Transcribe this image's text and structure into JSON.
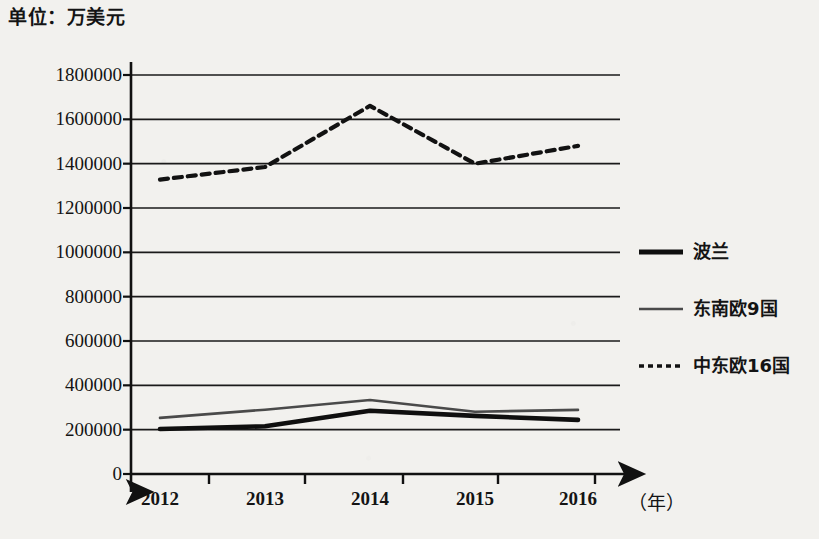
{
  "chart_data": {
    "type": "line",
    "title": "单位：万美元",
    "xlabel": "（年）",
    "ylabel": "",
    "categories": [
      "2012",
      "2013",
      "2014",
      "2015",
      "2016"
    ],
    "x_axis_title": "（年）",
    "ylim": [
      0,
      1800000
    ],
    "yticks": [
      "1800000",
      "1600000",
      "1400000",
      "1200000",
      "1000000",
      "800000",
      "600000",
      "400000",
      "200000",
      "0"
    ],
    "ytick_values": [
      1800000,
      1600000,
      1400000,
      1200000,
      1000000,
      800000,
      600000,
      400000,
      200000,
      0
    ],
    "grid": true,
    "grid_axis": "y",
    "legend_position": "right",
    "series": [
      {
        "name": "波兰",
        "style": "solid-thick",
        "color": "#0f0f0f",
        "values": [
          203000,
          215000,
          285000,
          262000,
          244000
        ]
      },
      {
        "name": "东南欧9国",
        "style": "solid-thin",
        "color": "#4a4a4a",
        "values": [
          253000,
          290000,
          334000,
          281000,
          289000
        ]
      },
      {
        "name": "中东欧16国",
        "style": "dashed",
        "color": "#121212",
        "values": [
          1328000,
          1385000,
          1661000,
          1400000,
          1480000
        ]
      }
    ]
  },
  "axis": {
    "y_arrow": true,
    "x_arrow": true,
    "line_color": "#111111"
  },
  "legend": {
    "items": [
      {
        "label": "波兰",
        "style": "solid-thick"
      },
      {
        "label": "东南欧9国",
        "style": "solid-thin"
      },
      {
        "label": "中东欧16国",
        "style": "dashed"
      }
    ]
  }
}
